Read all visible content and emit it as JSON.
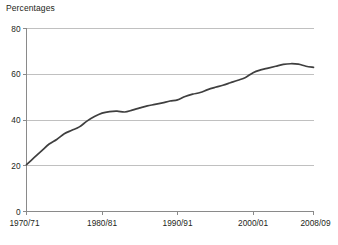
{
  "chart_data": {
    "type": "line",
    "title": "Percentages",
    "xlabel": "",
    "ylabel": "",
    "ylim": [
      0,
      80
    ],
    "yticks": [
      0,
      20,
      40,
      60,
      80
    ],
    "ytick_labels": [
      "0",
      "20",
      "40",
      "60",
      "80"
    ],
    "xticks": [
      "1970/71",
      "1980/81",
      "1990/91",
      "2000/01",
      "2008/09"
    ],
    "xtick_labels": [
      "1970/71",
      "1980/81",
      "1990/91",
      "2000/01",
      "2008/09"
    ],
    "grid": "horizontal",
    "legend": "none",
    "line_color": "#3f3f3f",
    "grid_color": "#b9b9b9",
    "axis_color": "#8a8a8a",
    "x": [
      "1970/71",
      "1971/72",
      "1972/73",
      "1973/74",
      "1974/75",
      "1975/76",
      "1976/77",
      "1977/78",
      "1978/79",
      "1979/80",
      "1980/81",
      "1981/82",
      "1982/83",
      "1983/84",
      "1984/85",
      "1985/86",
      "1986/87",
      "1987/88",
      "1988/89",
      "1989/90",
      "1990/91",
      "1991/92",
      "1992/93",
      "1993/94",
      "1994/95",
      "1995/96",
      "1996/97",
      "1997/98",
      "1998/99",
      "1999/00",
      "2000/01",
      "2001/02",
      "2002/03",
      "2003/04",
      "2004/05",
      "2005/06",
      "2006/07",
      "2007/08",
      "2008/09"
    ],
    "values": [
      20.5,
      23.5,
      26.5,
      29.5,
      31.5,
      34.0,
      35.5,
      37.0,
      39.5,
      41.5,
      43.0,
      43.7,
      43.9,
      43.5,
      44.3,
      45.3,
      46.2,
      46.8,
      47.5,
      48.3,
      48.8,
      50.3,
      51.3,
      52.0,
      53.3,
      54.3,
      55.2,
      56.3,
      57.4,
      58.6,
      60.7,
      61.9,
      62.7,
      63.5,
      64.3,
      64.6,
      64.4,
      63.5,
      63.0
    ],
    "series": [
      {
        "name": "Percentage",
        "values": [
          20.5,
          23.5,
          26.5,
          29.5,
          31.5,
          34.0,
          35.5,
          37.0,
          39.5,
          41.5,
          43.0,
          43.7,
          43.9,
          43.5,
          44.3,
          45.3,
          46.2,
          46.8,
          47.5,
          48.3,
          48.8,
          50.3,
          51.3,
          52.0,
          53.3,
          54.3,
          55.2,
          56.3,
          57.4,
          58.6,
          60.7,
          61.9,
          62.7,
          63.5,
          64.3,
          64.6,
          64.4,
          63.5,
          63.0
        ]
      }
    ]
  }
}
